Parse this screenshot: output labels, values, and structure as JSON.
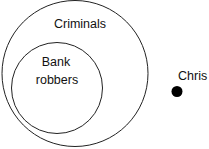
{
  "diagram": {
    "type": "euler-diagram",
    "outer_set": {
      "label": "Criminals",
      "stroke": "#222222"
    },
    "inner_set": {
      "label_line1": "Bank",
      "label_line2": "robbers",
      "stroke": "#222222"
    },
    "element": {
      "label": "Chris",
      "fill": "#000000"
    }
  }
}
